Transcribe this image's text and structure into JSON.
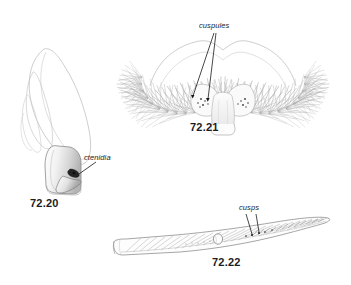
{
  "plate": {
    "background_color": "#ffffff",
    "ink_color": "#6f6f6f",
    "dark_ink_color": "#1a1a1a",
    "width": 351,
    "height": 285
  },
  "figures": [
    {
      "number": "72.20",
      "subject": "maxilla-with-ctenidia",
      "label": "ctenidia",
      "label_style": "italic",
      "leader_lines": 1
    },
    {
      "number": "72.21",
      "subject": "setose-fan-with-cuspules",
      "label": "cuspules",
      "label_style": "italic",
      "leader_lines": 2
    },
    {
      "number": "72.22",
      "subject": "hairy-appendage-with-cusps",
      "label": "cusps",
      "label_style": "italic",
      "leader_lines": 2
    }
  ]
}
